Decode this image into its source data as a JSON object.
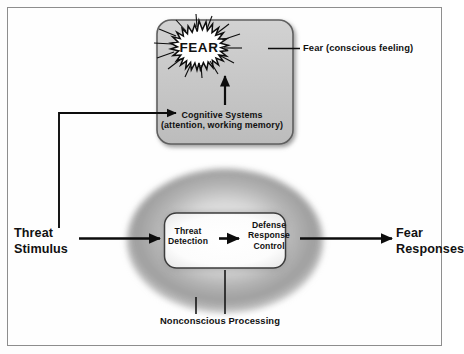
{
  "figure": {
    "frame_border_color": "#8d8d8d",
    "background_color": "#fefefe"
  },
  "conscious_box": {
    "name": "conscious-systems-box",
    "fill_color": "#c8c8c8",
    "border_color": "#6e6e6e",
    "starburst": {
      "label": "FEAR",
      "fill_color": "#ffffff",
      "outline_color": "#0d0d0d",
      "points": 26
    },
    "cognitive_systems": {
      "line1": "Cognitive Systems",
      "line2": "(attention, working memory)"
    }
  },
  "annotations": {
    "fear_conscious": "Fear (conscious feeling)",
    "nonconscious": "Nonconscious Processing"
  },
  "nonconscious_oval": {
    "name": "nonconscious-processing-oval",
    "fill_color": "#a8a8a8",
    "inner_box": {
      "fill_color": "#ffffff",
      "border_color": "#4a4a4a",
      "stages": [
        {
          "line1": "Threat",
          "line2": "Detection"
        },
        {
          "line1": "Defense",
          "line2": "Response",
          "line3": "Control"
        }
      ]
    }
  },
  "inputs": {
    "threat_stimulus": {
      "line1": "Threat",
      "line2": "Stimulus"
    }
  },
  "outputs": {
    "fear_responses": {
      "line1": "Fear",
      "line2": "Responses"
    }
  },
  "arrow_color": "#0d0d0d"
}
